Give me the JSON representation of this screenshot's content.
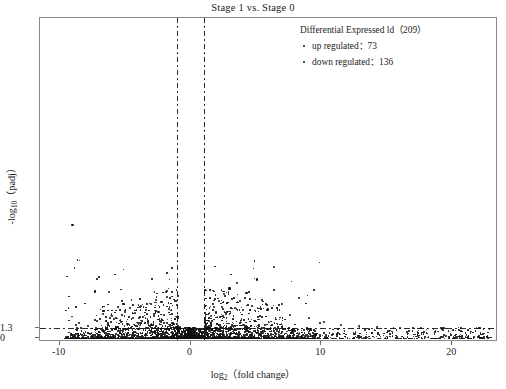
{
  "chart_data": {
    "type": "scatter",
    "title": "Stage 1 vs. Stage 0",
    "xlabel": "log2 ( fold change )",
    "ylabel": "-log10 ( padj )",
    "xlim": [
      -11.5,
      23.5
    ],
    "ylim": [
      -0.55,
      42.5
    ],
    "xticks": [
      -10,
      0,
      10,
      20
    ],
    "xticklabels": [
      "-10",
      "0",
      "10",
      "20"
    ],
    "yticks": [
      0,
      1.3
    ],
    "yticklabels": [
      "0",
      "1.3"
    ],
    "grid": false,
    "legend_position": "top-right",
    "threshold_lines": {
      "vertical": [
        -1,
        1
      ],
      "horizontal": [
        1.3
      ],
      "style": "dash-dot"
    },
    "annotations": {
      "significance_cutoff_label": "1.3"
    },
    "series": [
      {
        "name": "up regulated",
        "count": 73,
        "marker": "dot",
        "color": "#111111"
      },
      {
        "name": "down regulated",
        "count": 136,
        "marker": "dot",
        "color": "#111111"
      }
    ],
    "points": [
      [
        -9.1,
        15.1
      ],
      [
        -7.4,
        6.3
      ],
      [
        -6.3,
        6.2
      ],
      [
        -5.2,
        4.6
      ],
      [
        -8.6,
        2.1
      ],
      [
        -7.9,
        1.7
      ],
      [
        -7.2,
        2.4
      ],
      [
        -6.8,
        3.3
      ],
      [
        -6.4,
        1.9
      ],
      [
        -6.1,
        3.0
      ],
      [
        -5.9,
        2.6
      ],
      [
        -5.6,
        4.2
      ],
      [
        -5.4,
        2.2
      ],
      [
        -5.1,
        3.6
      ],
      [
        -4.9,
        2.0
      ],
      [
        -4.7,
        4.1
      ],
      [
        -4.5,
        2.8
      ],
      [
        -4.3,
        3.4
      ],
      [
        -4.1,
        2.1
      ],
      [
        -3.9,
        4.4
      ],
      [
        -3.7,
        2.9
      ],
      [
        -3.5,
        3.8
      ],
      [
        -3.3,
        2.3
      ],
      [
        -3.1,
        4.7
      ],
      [
        -2.9,
        3.1
      ],
      [
        -2.7,
        5.2
      ],
      [
        -2.5,
        3.6
      ],
      [
        -2.3,
        4.9
      ],
      [
        -2.1,
        3.2
      ],
      [
        -1.9,
        5.6
      ],
      [
        -1.7,
        4.0
      ],
      [
        -1.5,
        3.3
      ],
      [
        -1.3,
        2.6
      ],
      [
        -1.1,
        2.0
      ],
      [
        -0.9,
        1.6
      ],
      [
        1.1,
        1.8
      ],
      [
        1.3,
        2.4
      ],
      [
        1.5,
        3.0
      ],
      [
        1.7,
        4.2
      ],
      [
        1.9,
        3.5
      ],
      [
        2.1,
        5.1
      ],
      [
        2.3,
        4.3
      ],
      [
        2.5,
        6.0
      ],
      [
        2.7,
        4.8
      ],
      [
        2.9,
        6.7
      ],
      [
        3.1,
        5.3
      ],
      [
        3.3,
        4.1
      ],
      [
        3.5,
        7.4
      ],
      [
        3.7,
        5.0
      ],
      [
        3.9,
        3.8
      ],
      [
        4.2,
        6.1
      ],
      [
        4.6,
        4.4
      ],
      [
        5.0,
        7.9
      ],
      [
        5.4,
        5.2
      ],
      [
        5.8,
        3.9
      ],
      [
        6.3,
        9.6
      ],
      [
        6.9,
        4.6
      ],
      [
        7.5,
        3.2
      ],
      [
        8.2,
        5.4
      ],
      [
        9.0,
        2.8
      ],
      [
        10.1,
        2.2
      ],
      [
        11.4,
        1.9
      ],
      [
        12.8,
        1.7
      ],
      [
        14.2,
        1.6
      ],
      [
        15.9,
        1.5
      ],
      [
        17.5,
        1.5
      ],
      [
        19.1,
        1.4
      ],
      [
        20.6,
        1.4
      ],
      [
        22.0,
        1.4
      ]
    ]
  },
  "legend": {
    "title": "Differential Expressed ld（209）",
    "rows": [
      {
        "label": "up regulated：73"
      },
      {
        "label": "down regulated：136"
      }
    ]
  },
  "axes": {
    "x_title_main": "log",
    "x_title_sub": "2",
    "x_title_tail": "（fold change）",
    "y_title_main": "-log",
    "y_title_sub": "10",
    "y_title_tail": "（padj）"
  }
}
